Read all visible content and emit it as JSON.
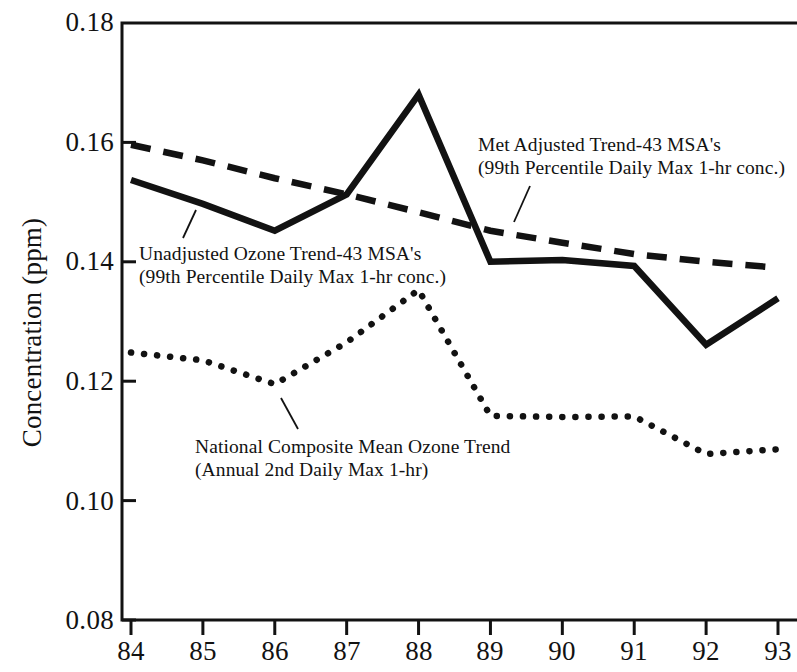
{
  "chart_data": {
    "type": "line",
    "title": "",
    "xlabel": "",
    "ylabel": "Concentration (ppm)",
    "x": [
      84,
      85,
      86,
      87,
      88,
      89,
      90,
      91,
      92,
      93
    ],
    "xticklabels": [
      "84",
      "85",
      "86",
      "87",
      "88",
      "89",
      "90",
      "91",
      "92",
      "93"
    ],
    "yticklabels": [
      "0.18",
      "0.16",
      "0.14",
      "0.12",
      "0.10",
      "0.08"
    ],
    "ytickvalues": [
      0.18,
      0.16,
      0.14,
      0.12,
      0.1,
      0.08
    ],
    "ylim": [
      0.08,
      0.18
    ],
    "xlim": [
      84,
      93
    ],
    "grid": false,
    "legend": "annotations-inline",
    "series": [
      {
        "name": "Met Adjusted Trend-43 MSA's",
        "style": "dashed",
        "values": [
          0.1596,
          0.157,
          0.154,
          0.1513,
          0.1483,
          0.1452,
          0.1432,
          0.1413,
          0.14,
          0.139
        ]
      },
      {
        "name": "Unadjusted Ozone Trend-43 MSA's",
        "style": "solid",
        "values": [
          0.1537,
          0.1497,
          0.1452,
          0.1513,
          0.168,
          0.14,
          0.1403,
          0.1393,
          0.1261,
          0.1339
        ]
      },
      {
        "name": "National Composite Mean Ozone Trend",
        "style": "dotted",
        "values": [
          0.1248,
          0.1235,
          0.1195,
          0.1265,
          0.1353,
          0.1142,
          0.114,
          0.1141,
          0.1078,
          0.1086
        ]
      }
    ],
    "annotations": [
      {
        "id": "met-adjusted",
        "line1": "Met Adjusted Trend-43 MSA's",
        "line2": "(99th Percentile Daily Max 1-hr conc.)",
        "x": 478,
        "y": 133,
        "leader": {
          "x1": 530,
          "y1": 186,
          "x2": 514,
          "y2": 222
        }
      },
      {
        "id": "unadjusted-ozone",
        "line1": "Unadjusted Ozone Trend-43 MSA's",
        "line2": "(99th Percentile Daily Max 1-hr conc.)",
        "x": 139,
        "y": 242,
        "leader": {
          "x1": 196,
          "y1": 210,
          "x2": 183,
          "y2": 238
        }
      },
      {
        "id": "national-composite",
        "line1": "National Composite Mean Ozone Trend",
        "line2": "(Annual 2nd Daily Max 1-hr)",
        "x": 195,
        "y": 435,
        "leader": {
          "x1": 281,
          "y1": 398,
          "x2": 298,
          "y2": 429
        }
      }
    ],
    "colors": {
      "ink": "#121212",
      "background": "#ffffff"
    }
  },
  "axes": {
    "y_title": "Concentration (ppm)",
    "y_ticks": [
      {
        "label": "0.18",
        "value": 0.18
      },
      {
        "label": "0.16",
        "value": 0.16
      },
      {
        "label": "0.14",
        "value": 0.14
      },
      {
        "label": "0.12",
        "value": 0.12
      },
      {
        "label": "0.10",
        "value": 0.1
      },
      {
        "label": "0.08",
        "value": 0.08
      }
    ],
    "x_ticks": [
      {
        "label": "84",
        "value": 84
      },
      {
        "label": "85",
        "value": 85
      },
      {
        "label": "86",
        "value": 86
      },
      {
        "label": "87",
        "value": 87
      },
      {
        "label": "88",
        "value": 88
      },
      {
        "label": "89",
        "value": 89
      },
      {
        "label": "90",
        "value": 90
      },
      {
        "label": "91",
        "value": 91
      },
      {
        "label": "92",
        "value": 92
      },
      {
        "label": "93",
        "value": 93
      }
    ]
  }
}
